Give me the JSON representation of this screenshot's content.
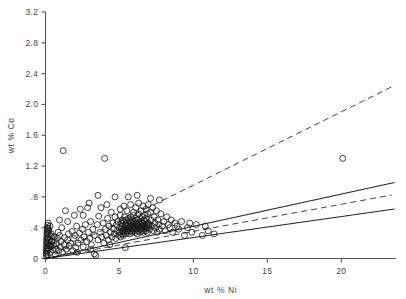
{
  "figure": {
    "background_color": "#ffffff",
    "marker_color": "#111111",
    "axis_color": "#555555",
    "solid_line_color": "#222222",
    "dashed_line_color": "#444444"
  },
  "chart_data": {
    "type": "scatter",
    "title": "",
    "xlabel": "wt % Ni",
    "ylabel": "wt % Co",
    "xlim": [
      0,
      23.7
    ],
    "ylim": [
      0,
      3.2
    ],
    "grid": false,
    "legend": null,
    "xticks": [
      0,
      5,
      10,
      15,
      20
    ],
    "xtick_labels": [
      "0",
      "5",
      "10",
      "15",
      "20"
    ],
    "yticks": [
      0,
      0.4,
      0.8,
      1.2,
      1.6,
      2.0,
      2.4,
      2.8,
      3.2
    ],
    "ytick_labels": [
      "0",
      ".4",
      ".8",
      "1.2",
      "1.6",
      "2.0",
      "2.4",
      "2.8",
      "3.2"
    ],
    "marker": "open-circle",
    "marker_size": 3.0,
    "points": [
      [
        0.05,
        0.03
      ],
      [
        0.05,
        0.07
      ],
      [
        0.06,
        0.1
      ],
      [
        0.06,
        0.13
      ],
      [
        0.07,
        0.16
      ],
      [
        0.07,
        0.19
      ],
      [
        0.08,
        0.22
      ],
      [
        0.08,
        0.25
      ],
      [
        0.09,
        0.28
      ],
      [
        0.1,
        0.31
      ],
      [
        0.1,
        0.34
      ],
      [
        0.11,
        0.37
      ],
      [
        0.12,
        0.4
      ],
      [
        0.1,
        0.05
      ],
      [
        0.12,
        0.09
      ],
      [
        0.14,
        0.14
      ],
      [
        0.15,
        0.2
      ],
      [
        0.16,
        0.26
      ],
      [
        0.18,
        0.33
      ],
      [
        0.2,
        0.39
      ],
      [
        0.22,
        0.12
      ],
      [
        0.25,
        0.18
      ],
      [
        0.28,
        0.24
      ],
      [
        0.3,
        0.3
      ],
      [
        0.33,
        0.08
      ],
      [
        0.36,
        0.16
      ],
      [
        0.4,
        0.22
      ],
      [
        0.45,
        0.28
      ],
      [
        0.5,
        0.11
      ],
      [
        0.55,
        0.17
      ],
      [
        0.6,
        0.23
      ],
      [
        0.65,
        0.05
      ],
      [
        0.7,
        0.13
      ],
      [
        0.75,
        0.19
      ],
      [
        0.8,
        0.26
      ],
      [
        0.9,
        0.1
      ],
      [
        0.95,
        0.3
      ],
      [
        1.0,
        0.15
      ],
      [
        1.05,
        0.22
      ],
      [
        1.15,
        0.08
      ],
      [
        1.2,
        1.4
      ],
      [
        1.25,
        0.18
      ],
      [
        1.3,
        0.27
      ],
      [
        1.4,
        0.12
      ],
      [
        1.5,
        0.24
      ],
      [
        1.55,
        0.32
      ],
      [
        1.6,
        0.16
      ],
      [
        1.7,
        0.2
      ],
      [
        1.8,
        0.35
      ],
      [
        1.85,
        0.1
      ],
      [
        1.9,
        0.26
      ],
      [
        2.0,
        0.3
      ],
      [
        2.05,
        0.14
      ],
      [
        2.1,
        0.42
      ],
      [
        2.2,
        0.2
      ],
      [
        2.3,
        0.33
      ],
      [
        2.4,
        0.24
      ],
      [
        2.5,
        0.38
      ],
      [
        2.55,
        0.15
      ],
      [
        2.6,
        0.28
      ],
      [
        2.7,
        0.44
      ],
      [
        2.8,
        0.22
      ],
      [
        2.85,
        0.66
      ],
      [
        2.9,
        0.34
      ],
      [
        3.0,
        0.26
      ],
      [
        3.05,
        0.48
      ],
      [
        3.1,
        0.18
      ],
      [
        3.2,
        0.38
      ],
      [
        3.3,
        0.3
      ],
      [
        3.4,
        0.04
      ],
      [
        3.5,
        0.44
      ],
      [
        3.55,
        0.24
      ],
      [
        3.6,
        0.55
      ],
      [
        3.7,
        0.34
      ],
      [
        3.8,
        0.28
      ],
      [
        3.9,
        0.46
      ],
      [
        3.95,
        0.2
      ],
      [
        4.0,
        1.3
      ],
      [
        4.05,
        0.38
      ],
      [
        4.1,
        0.3
      ],
      [
        4.2,
        0.52
      ],
      [
        4.25,
        0.24
      ],
      [
        4.3,
        0.42
      ],
      [
        4.4,
        0.34
      ],
      [
        4.45,
        0.6
      ],
      [
        4.5,
        0.28
      ],
      [
        4.55,
        0.46
      ],
      [
        4.6,
        0.38
      ],
      [
        4.65,
        0.32
      ],
      [
        4.7,
        0.54
      ],
      [
        4.75,
        0.26
      ],
      [
        4.8,
        0.44
      ],
      [
        4.85,
        0.36
      ],
      [
        4.9,
        0.48
      ],
      [
        4.95,
        0.3
      ],
      [
        5.0,
        0.4
      ],
      [
        5.02,
        0.34
      ],
      [
        5.05,
        0.56
      ],
      [
        5.08,
        0.28
      ],
      [
        5.1,
        0.46
      ],
      [
        5.12,
        0.38
      ],
      [
        5.15,
        0.32
      ],
      [
        5.18,
        0.5
      ],
      [
        5.2,
        0.42
      ],
      [
        5.22,
        0.36
      ],
      [
        5.25,
        0.3
      ],
      [
        5.28,
        0.48
      ],
      [
        5.3,
        0.4
      ],
      [
        5.32,
        0.34
      ],
      [
        5.35,
        0.54
      ],
      [
        5.38,
        0.44
      ],
      [
        5.4,
        0.38
      ],
      [
        5.42,
        0.32
      ],
      [
        5.45,
        0.5
      ],
      [
        5.48,
        0.42
      ],
      [
        5.5,
        0.36
      ],
      [
        5.52,
        0.46
      ],
      [
        5.55,
        0.4
      ],
      [
        5.58,
        0.34
      ],
      [
        5.6,
        0.52
      ],
      [
        5.62,
        0.44
      ],
      [
        5.65,
        0.38
      ],
      [
        5.68,
        0.32
      ],
      [
        5.7,
        0.48
      ],
      [
        5.72,
        0.42
      ],
      [
        5.75,
        0.36
      ],
      [
        5.78,
        0.54
      ],
      [
        5.8,
        0.46
      ],
      [
        5.82,
        0.4
      ],
      [
        5.85,
        0.34
      ],
      [
        5.88,
        0.5
      ],
      [
        5.9,
        0.44
      ],
      [
        5.92,
        0.38
      ],
      [
        5.95,
        0.56
      ],
      [
        5.98,
        0.42
      ],
      [
        6.0,
        0.36
      ],
      [
        6.02,
        0.48
      ],
      [
        6.05,
        0.4
      ],
      [
        6.08,
        0.34
      ],
      [
        6.1,
        0.52
      ],
      [
        6.12,
        0.46
      ],
      [
        6.15,
        0.38
      ],
      [
        6.18,
        0.44
      ],
      [
        6.2,
        0.32
      ],
      [
        6.22,
        0.5
      ],
      [
        6.25,
        0.42
      ],
      [
        6.28,
        0.36
      ],
      [
        6.3,
        0.58
      ],
      [
        6.32,
        0.46
      ],
      [
        6.35,
        0.4
      ],
      [
        6.38,
        0.34
      ],
      [
        6.4,
        0.52
      ],
      [
        6.42,
        0.44
      ],
      [
        6.45,
        0.38
      ],
      [
        6.48,
        0.48
      ],
      [
        6.5,
        0.42
      ],
      [
        6.52,
        0.36
      ],
      [
        6.55,
        0.54
      ],
      [
        6.58,
        0.46
      ],
      [
        6.6,
        0.4
      ],
      [
        6.62,
        0.34
      ],
      [
        6.65,
        0.5
      ],
      [
        6.68,
        0.44
      ],
      [
        6.7,
        0.38
      ],
      [
        6.72,
        0.56
      ],
      [
        6.75,
        0.48
      ],
      [
        6.78,
        0.42
      ],
      [
        6.8,
        0.36
      ],
      [
        6.82,
        0.52
      ],
      [
        6.85,
        0.44
      ],
      [
        6.88,
        0.4
      ],
      [
        6.9,
        0.34
      ],
      [
        6.92,
        0.58
      ],
      [
        6.95,
        0.46
      ],
      [
        6.98,
        0.42
      ],
      [
        5.05,
        0.64
      ],
      [
        5.3,
        0.68
      ],
      [
        5.5,
        0.62
      ],
      [
        5.75,
        0.7
      ],
      [
        5.95,
        0.6
      ],
      [
        6.1,
        0.66
      ],
      [
        6.3,
        0.72
      ],
      [
        6.45,
        0.62
      ],
      [
        6.6,
        0.68
      ],
      [
        6.8,
        0.64
      ],
      [
        6.95,
        0.7
      ],
      [
        7.0,
        0.44
      ],
      [
        7.05,
        0.38
      ],
      [
        7.1,
        0.6
      ],
      [
        7.15,
        0.5
      ],
      [
        7.2,
        0.42
      ],
      [
        7.25,
        0.66
      ],
      [
        7.3,
        0.36
      ],
      [
        7.35,
        0.54
      ],
      [
        7.4,
        0.46
      ],
      [
        7.45,
        0.4
      ],
      [
        7.5,
        0.62
      ],
      [
        7.55,
        0.34
      ],
      [
        7.6,
        0.5
      ],
      [
        7.65,
        0.44
      ],
      [
        7.7,
        0.38
      ],
      [
        7.8,
        0.58
      ],
      [
        7.9,
        0.42
      ],
      [
        8.0,
        0.48
      ],
      [
        8.1,
        0.36
      ],
      [
        8.2,
        0.54
      ],
      [
        8.3,
        0.44
      ],
      [
        8.4,
        0.4
      ],
      [
        8.5,
        0.5
      ],
      [
        8.6,
        0.34
      ],
      [
        8.75,
        0.46
      ],
      [
        8.9,
        0.42
      ],
      [
        9.0,
        0.38
      ],
      [
        9.2,
        0.48
      ],
      [
        9.4,
        0.3
      ],
      [
        9.6,
        0.4
      ],
      [
        9.9,
        0.34
      ],
      [
        10.2,
        0.44
      ],
      [
        10.6,
        0.3
      ],
      [
        11.0,
        0.36
      ],
      [
        5.6,
        0.8
      ],
      [
        6.2,
        0.82
      ],
      [
        7.1,
        0.78
      ],
      [
        7.7,
        0.76
      ],
      [
        4.7,
        0.8
      ],
      [
        3.55,
        0.82
      ],
      [
        2.95,
        0.72
      ],
      [
        2.35,
        0.64
      ],
      [
        1.95,
        0.56
      ],
      [
        1.5,
        0.48
      ],
      [
        1.1,
        0.4
      ],
      [
        0.85,
        0.34
      ],
      [
        0.6,
        0.28
      ],
      [
        0.42,
        0.22
      ],
      [
        0.28,
        0.16
      ],
      [
        3.3,
        0.06
      ],
      [
        4.35,
        0.18
      ],
      [
        5.4,
        0.14
      ],
      [
        3.05,
        0.12
      ],
      [
        2.15,
        0.08
      ],
      [
        20.1,
        1.3
      ],
      [
        11.4,
        0.32
      ],
      [
        10.8,
        0.42
      ],
      [
        9.75,
        0.46
      ],
      [
        0.15,
        0.43
      ],
      [
        0.18,
        0.46
      ],
      [
        0.22,
        0.36
      ],
      [
        0.3,
        0.42
      ],
      [
        0.38,
        0.32
      ],
      [
        1.35,
        0.62
      ],
      [
        2.55,
        0.56
      ],
      [
        3.75,
        0.66
      ],
      [
        4.15,
        0.7
      ],
      [
        0.95,
        0.5
      ]
    ],
    "fit_lines": [
      {
        "name": "upper-dashed-bound",
        "style": "dashed",
        "slope": 0.0952,
        "intercept": 0.0,
        "x_start": 0.0,
        "x_end": 23.4
      },
      {
        "name": "upper-solid-fit",
        "style": "solid",
        "slope": 0.0418,
        "intercept": 0.0,
        "x_start": 0.0,
        "x_end": 23.6
      },
      {
        "name": "middle-dashed-fit",
        "style": "dashed",
        "slope": 0.0352,
        "intercept": 0.0,
        "x_start": 0.0,
        "x_end": 23.4
      },
      {
        "name": "lower-solid-bound",
        "style": "solid",
        "slope": 0.0272,
        "intercept": 0.0,
        "x_start": 0.0,
        "x_end": 23.6
      }
    ]
  }
}
